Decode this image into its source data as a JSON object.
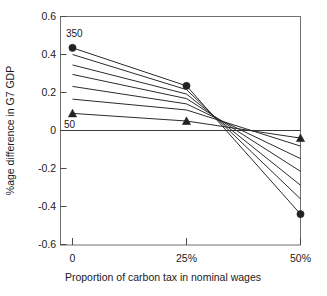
{
  "chart_data": {
    "type": "line",
    "title": "",
    "xlabel": "Proportion of carbon tax in nominal wages",
    "ylabel": "%age difference in G7 GDP",
    "x": [
      0,
      25,
      50
    ],
    "x_tick_labels": [
      "0",
      "25%",
      "50%"
    ],
    "y_tick_labels": [
      "0.6",
      "0.4",
      "0.2",
      "0",
      "-0.2",
      "-0.4",
      "-0.6"
    ],
    "y_tick_values": [
      0.6,
      0.4,
      0.2,
      0,
      -0.2,
      -0.4,
      -0.6
    ],
    "xlim": [
      0,
      50
    ],
    "ylim": [
      -0.6,
      0.6
    ],
    "grid": false,
    "legend": "inline-annotations",
    "zero_reference_line": true,
    "annotations": [
      {
        "text": "350",
        "x": 0,
        "y": 0.435,
        "placement": "above-left-marker"
      },
      {
        "text": "50",
        "x": 0,
        "y": 0.09,
        "placement": "below-left-marker"
      }
    ],
    "series": [
      {
        "name": "350",
        "marker": "circle",
        "values": [
          0.435,
          0.235,
          -0.44
        ]
      },
      {
        "name": "300",
        "marker": "none",
        "values": [
          0.4,
          0.215,
          -0.36
        ]
      },
      {
        "name": "250",
        "marker": "none",
        "values": [
          0.345,
          0.192,
          -0.288
        ]
      },
      {
        "name": "200",
        "marker": "none",
        "values": [
          0.295,
          0.168,
          -0.215
        ]
      },
      {
        "name": "150",
        "marker": "none",
        "values": [
          0.232,
          0.14,
          -0.148
        ]
      },
      {
        "name": "100",
        "marker": "none",
        "values": [
          0.165,
          0.108,
          -0.082
        ]
      },
      {
        "name": "50",
        "marker": "triangle",
        "values": [
          0.09,
          0.05,
          -0.04
        ]
      }
    ]
  },
  "axes": {
    "y_title": "%age difference in G7 GDP",
    "x_title": "Proportion of carbon tax in nominal wages",
    "y_ticks": [
      "0.6",
      "0.4",
      "0.2",
      "0",
      "-0.2",
      "-0.4",
      "-0.6"
    ],
    "x_ticks": [
      "0",
      "25%",
      "50%"
    ]
  },
  "labels": {
    "top_series": "350",
    "bottom_series": "50"
  },
  "colors": {
    "line": "#2b2b2b",
    "marker": "#222222",
    "frame": "#6f6f6f",
    "background": "#ffffff",
    "text": "#1a1a1a"
  }
}
